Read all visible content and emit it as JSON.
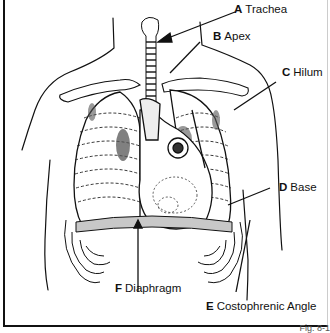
{
  "diagram": {
    "labels": [
      {
        "letter": "A",
        "text": "Trachea"
      },
      {
        "letter": "B",
        "text": "Apex"
      },
      {
        "letter": "C",
        "text": "Hilum"
      },
      {
        "letter": "D",
        "text": "Base"
      },
      {
        "letter": "E",
        "text": "Costophrenic Angle"
      },
      {
        "letter": "F",
        "text": "Diaphragm"
      }
    ],
    "figure_caption": "Fig. 8-1"
  },
  "colors": {
    "line": "#111111",
    "background": "#ffffff",
    "shade": "#bdbdbd"
  }
}
